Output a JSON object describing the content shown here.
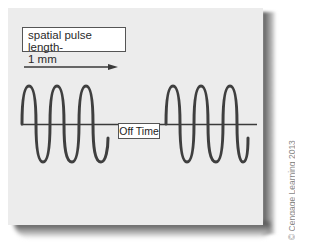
{
  "diagram": {
    "label": {
      "line1": "spatial pulse length-",
      "line2": "1 mm"
    },
    "off_time_label": "Off Time",
    "credit": "© Cengage Learning 2013",
    "colors": {
      "card_background": "#ececec",
      "wave": "#3a3a3a",
      "baseline": "#3a3a3a",
      "arrow": "#3a3a3a"
    },
    "pulses": [
      {
        "name": "pulse-1",
        "cycles": 3
      },
      {
        "name": "pulse-2",
        "cycles": 3
      }
    ]
  }
}
